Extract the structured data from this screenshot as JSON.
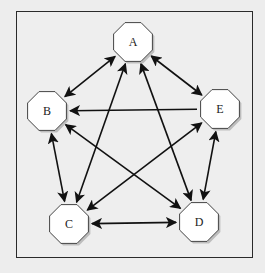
{
  "diagram": {
    "type": "directed-graph",
    "colors": {
      "background": "#ededed",
      "frame_border": "#2a2a2a",
      "node_fill": "#ffffff",
      "node_stroke": "#444444",
      "node_shadow": "#bdbdbd",
      "edge": "#111111"
    },
    "nodes": [
      {
        "id": "A",
        "label": "A",
        "x": 133,
        "y": 42
      },
      {
        "id": "B",
        "label": "B",
        "x": 47,
        "y": 111
      },
      {
        "id": "E",
        "label": "E",
        "x": 220,
        "y": 109
      },
      {
        "id": "C",
        "label": "C",
        "x": 69,
        "y": 224
      },
      {
        "id": "D",
        "label": "D",
        "x": 199,
        "y": 222
      }
    ],
    "edges": [
      {
        "from": "A",
        "to": "B",
        "bidirectional": true
      },
      {
        "from": "A",
        "to": "E",
        "bidirectional": true
      },
      {
        "from": "A",
        "to": "C",
        "bidirectional": true
      },
      {
        "from": "A",
        "to": "D",
        "bidirectional": true
      },
      {
        "from": "E",
        "to": "B",
        "bidirectional": false
      },
      {
        "from": "B",
        "to": "C",
        "bidirectional": true
      },
      {
        "from": "B",
        "to": "D",
        "bidirectional": true
      },
      {
        "from": "E",
        "to": "C",
        "bidirectional": true
      },
      {
        "from": "E",
        "to": "D",
        "bidirectional": true
      },
      {
        "from": "C",
        "to": "D",
        "bidirectional": true
      }
    ]
  }
}
